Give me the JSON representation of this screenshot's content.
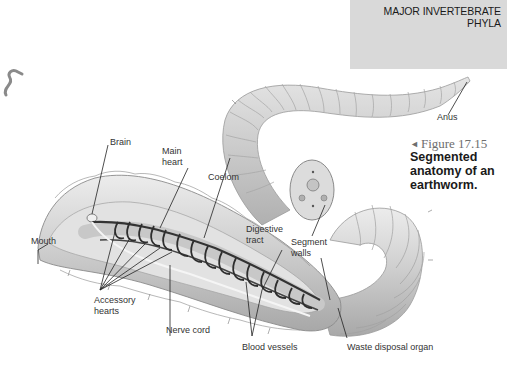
{
  "section_header": {
    "line1": "MAJOR INVERTEBRATE",
    "line2": "PHYLA",
    "background": "#d9d9d9"
  },
  "figure": {
    "arrow_glyph": "◄",
    "number": "Figure 17.15",
    "caption_line1": "Segmented",
    "caption_line2": "anatomy of an",
    "caption_line3": "earthworm."
  },
  "labels": {
    "brain": "Brain",
    "main_heart_1": "Main",
    "main_heart_2": "heart",
    "coelom": "Coelom",
    "digestive_tract_1": "Digestive",
    "digestive_tract_2": "tract",
    "segment_walls_1": "Segment",
    "segment_walls_2": "walls",
    "mouth": "Mouth",
    "accessory_hearts_1": "Accessory",
    "accessory_hearts_2": "hearts",
    "nerve_cord": "Nerve cord",
    "blood_vessels": "Blood vessels",
    "waste_disposal_organ": "Waste disposal organ",
    "anus": "Anus"
  },
  "colors": {
    "worm_body": "#c9c9c9",
    "worm_highlight": "#e8e8e8",
    "worm_shadow": "#9a9a9a",
    "vessels": "#3a3a3a",
    "leader_lines": "#222222"
  }
}
